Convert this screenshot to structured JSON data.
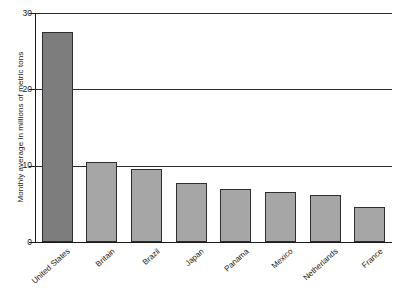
{
  "chart_data": {
    "type": "bar",
    "title": "",
    "subtitle": "",
    "xlabel": "",
    "ylabel": "Monthly average in millions of metric tons",
    "categories": [
      "United States",
      "Britain",
      "Brazil",
      "Japan",
      "Panama",
      "Mexico",
      "Netherlands",
      "France"
    ],
    "values": [
      27.5,
      10.5,
      9.6,
      7.7,
      7.0,
      6.5,
      6.2,
      4.6
    ],
    "ylim": [
      0,
      30
    ],
    "yticks": [
      0,
      10,
      20,
      30
    ],
    "ytick_labels": [
      "0",
      "10",
      "20",
      "30"
    ],
    "grid": true,
    "grid_axis": "y",
    "legend": false,
    "legend_position": "none",
    "bar_colors": [
      "#7d7d7d",
      "#a6a6a6",
      "#a6a6a6",
      "#a6a6a6",
      "#a6a6a6",
      "#a6a6a6",
      "#a6a6a6",
      "#a6a6a6"
    ],
    "bar_edge_color": "#2e2e2e",
    "axis_color": "#1a1a1a",
    "gridline_color": "#2b2b2b",
    "background_color": "#ffffff",
    "annotations": []
  }
}
